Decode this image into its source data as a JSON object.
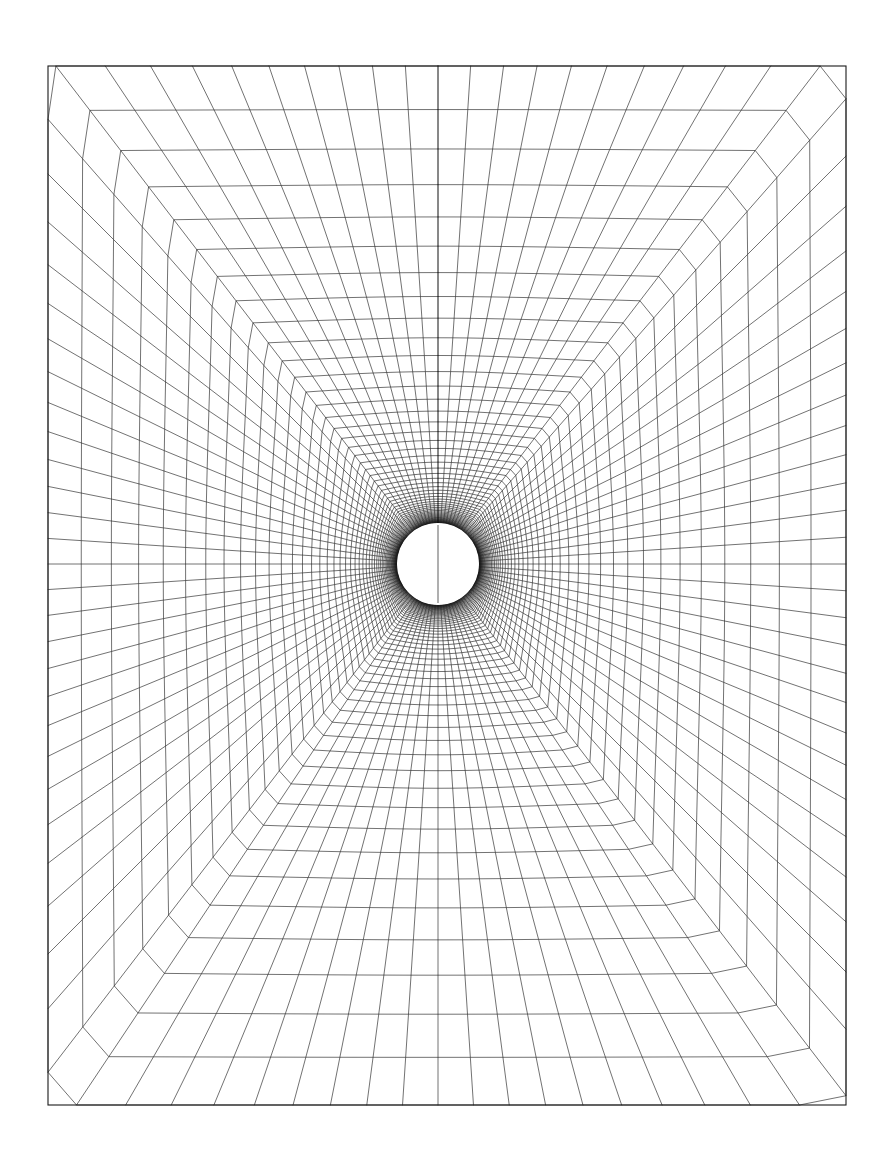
{
  "figure": {
    "type": "computational-mesh-diagram",
    "title": "",
    "caption": "",
    "background_color": "#ffffff",
    "line_color": "#1a1a1a",
    "canvas": {
      "width": 884,
      "height": 1168
    }
  },
  "frame": {
    "name": "outer-boundary-frame",
    "shape": "rectangle",
    "left": 48,
    "top": 66,
    "right": 846,
    "bottom": 1105,
    "width": 798,
    "height": 1039,
    "stroke_width": 1.1,
    "color": "#1a1a1a"
  },
  "body": {
    "name": "circular-cylinder-hole",
    "shape": "circle",
    "center_x": 438,
    "center_y": 564,
    "radius": 41,
    "fill": "#ffffff",
    "stroked": false
  },
  "branch_cut": {
    "name": "vertical-branch-cut",
    "orientation": "vertical-upward",
    "from_x": 438,
    "from_y": 523,
    "to_x": 438,
    "to_y": 66,
    "visible_segment_inside_circle": true,
    "stroke_width": 0.7
  },
  "chart_data": {
    "type": "line",
    "xlabel": "",
    "ylabel": "",
    "grid": true,
    "legend": null,
    "mesh": {
      "topology": "O-type structured grid with branch cut",
      "radial_lines_count": 96,
      "circumferential_rings_count": 58,
      "near_wall_clustering": "geometric stretching, first ring spacing ~0.6 px",
      "far_field_mapping": "circle-to-rectangle conformal blend",
      "inner_radius": 41,
      "outer_extent_x": 399,
      "outer_extent_y": 520,
      "center": [
        438,
        564
      ],
      "stretch_ratio": 1.105,
      "blend_exponent": 1.35,
      "ring_stroke_width": 0.62,
      "spoke_stroke_width": 0.62
    },
    "x": [],
    "values": [],
    "categories": []
  }
}
